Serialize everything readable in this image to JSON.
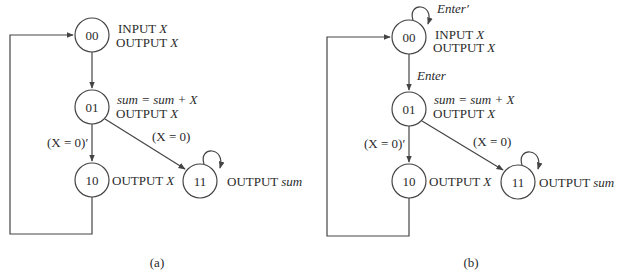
{
  "figure": {
    "panels": [
      {
        "id": "a",
        "caption": "(a)",
        "states": [
          {
            "code": "00",
            "lines": [
              [
                "INPUT ",
                "X"
              ],
              [
                "OUTPUT ",
                "X"
              ]
            ]
          },
          {
            "code": "01",
            "lines": [
              [
                "",
                "sum = sum + X"
              ],
              [
                "OUTPUT ",
                "X"
              ]
            ]
          },
          {
            "code": "10",
            "lines": [
              [
                "OUTPUT ",
                "X"
              ]
            ]
          },
          {
            "code": "11",
            "lines": [
              [
                "OUTPUT ",
                "sum"
              ]
            ]
          }
        ],
        "transitions": [
          {
            "from": "00",
            "to": "01",
            "condition": ""
          },
          {
            "from": "01",
            "to": "10",
            "condition": "(X = 0)′"
          },
          {
            "from": "01",
            "to": "11",
            "condition": "(X = 0)"
          },
          {
            "from": "10",
            "to": "00",
            "condition": ""
          },
          {
            "from": "11",
            "to": "11",
            "condition": ""
          }
        ]
      },
      {
        "id": "b",
        "caption": "(b)",
        "states": [
          {
            "code": "00",
            "lines": [
              [
                "INPUT ",
                "X"
              ],
              [
                "OUTPUT ",
                "X"
              ]
            ]
          },
          {
            "code": "01",
            "lines": [
              [
                "",
                "sum = sum + X"
              ],
              [
                "OUTPUT ",
                "X"
              ]
            ]
          },
          {
            "code": "10",
            "lines": [
              [
                "OUTPUT ",
                "X"
              ]
            ]
          },
          {
            "code": "11",
            "lines": [
              [
                "OUTPUT ",
                "sum"
              ]
            ]
          }
        ],
        "transitions": [
          {
            "from": "00",
            "to": "00",
            "condition": "Enter′"
          },
          {
            "from": "00",
            "to": "01",
            "condition": "Enter"
          },
          {
            "from": "01",
            "to": "10",
            "condition": "(X = 0)′"
          },
          {
            "from": "01",
            "to": "11",
            "condition": "(X = 0)"
          },
          {
            "from": "10",
            "to": "00",
            "condition": ""
          },
          {
            "from": "11",
            "to": "11",
            "condition": ""
          }
        ]
      }
    ]
  },
  "text": {
    "a": {
      "s00": "00",
      "s01": "01",
      "s10": "10",
      "s11": "11",
      "s00_l1_a": "INPUT ",
      "s00_l1_b": "X",
      "s00_l2_a": "OUTPUT ",
      "s00_l2_b": "X",
      "s01_l1": "sum = sum + X",
      "s01_l2_a": "OUTPUT ",
      "s01_l2_b": "X",
      "s10_l1_a": "OUTPUT ",
      "s10_l1_b": "X",
      "s11_l1_a": "OUTPUT ",
      "s11_l1_b": "sum",
      "cond_x0_not": "(X = 0)′",
      "cond_x0": "(X = 0)",
      "caption": "(a)"
    },
    "b": {
      "s00": "00",
      "s01": "01",
      "s10": "10",
      "s11": "11",
      "s00_l1_a": "INPUT ",
      "s00_l1_b": "X",
      "s00_l2_a": "OUTPUT ",
      "s00_l2_b": "X",
      "s01_l1": "sum = sum + X",
      "s01_l2_a": "OUTPUT ",
      "s01_l2_b": "X",
      "s10_l1_a": "OUTPUT ",
      "s10_l1_b": "X",
      "s11_l1_a": "OUTPUT ",
      "s11_l1_b": "sum",
      "cond_enter_not": "Enter′",
      "cond_enter": "Enter",
      "cond_x0_not": "(X = 0)′",
      "cond_x0": "(X = 0)",
      "caption": "(b)"
    }
  },
  "colors": {
    "stroke": "#444444",
    "text": "#2a2a2a",
    "background": "#ffffff"
  }
}
